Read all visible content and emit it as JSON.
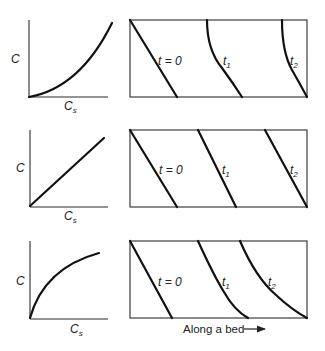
{
  "figure": {
    "rows": [
      {
        "isotherm": {
          "shape": "convex (unfavorable)",
          "y_label": "C",
          "x_label_main": "C",
          "x_label_sub": "s"
        },
        "profiles": {
          "labels": [
            {
              "main": "t = 0",
              "sub": ""
            },
            {
              "main": "t",
              "sub": "1"
            },
            {
              "main": "t",
              "sub": "2"
            }
          ],
          "behavior": "spreading front"
        }
      },
      {
        "isotherm": {
          "shape": "linear",
          "y_label": "C",
          "x_label_main": "C",
          "x_label_sub": "s"
        },
        "profiles": {
          "labels": [
            {
              "main": "t = 0",
              "sub": ""
            },
            {
              "main": "t",
              "sub": "1"
            },
            {
              "main": "t",
              "sub": "2"
            }
          ],
          "behavior": "constant-pattern front"
        }
      },
      {
        "isotherm": {
          "shape": "concave (favorable)",
          "y_label": "C",
          "x_label_main": "C",
          "x_label_sub": "s"
        },
        "profiles": {
          "labels": [
            {
              "main": "t = 0",
              "sub": ""
            },
            {
              "main": "t",
              "sub": "1"
            },
            {
              "main": "t",
              "sub": "2"
            }
          ],
          "behavior": "self-sharpening front"
        }
      }
    ],
    "bottom_caption": "Along a bed",
    "caption_arrow": "right-arrow"
  }
}
